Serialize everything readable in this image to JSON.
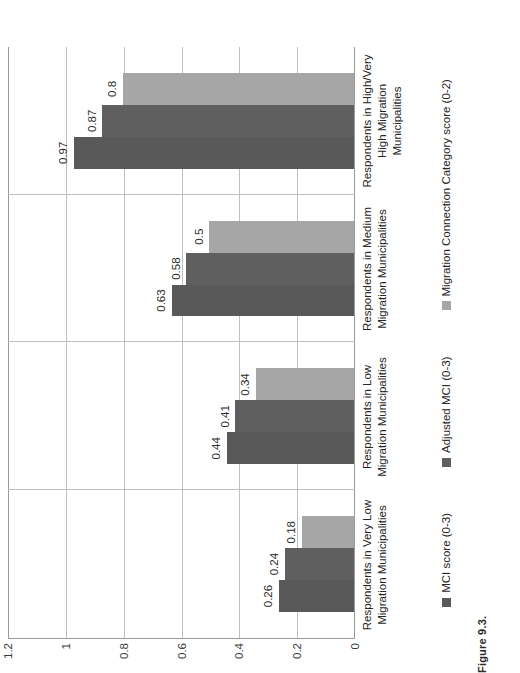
{
  "caption": "Figure 9.3.",
  "chart_data": {
    "type": "bar",
    "orientation": "horizontal",
    "title": "",
    "xlabel": "",
    "ylabel": "",
    "ylim": [
      0,
      1.2
    ],
    "grid": true,
    "legend_position": "bottom",
    "yticks": [
      "0",
      "0.2",
      "0.4",
      "0.6",
      "0.8",
      "1",
      "1.2"
    ],
    "ytick_values": [
      0,
      0.2,
      0.4,
      0.6,
      0.8,
      1,
      1.2
    ],
    "categories": [
      "Respondents in Very Low Migration Municipalities",
      "Respondents in Low Migration Municipalities",
      "Respondents in Medium Migration Municipalities",
      "Respondents in High/Very High Migration Municipalities"
    ],
    "series": [
      {
        "name": "MCI score (0-3)",
        "color": "#595959",
        "values": [
          0.26,
          0.44,
          0.63,
          0.97
        ],
        "labels": [
          "0.26",
          "0.44",
          "0.63",
          "0.97"
        ]
      },
      {
        "name": "Adjusted MCI (0-3)",
        "color": "#5f5f5f",
        "values": [
          0.24,
          0.41,
          0.58,
          0.87
        ],
        "labels": [
          "0.24",
          "0.41",
          "0.58",
          "0.87"
        ]
      },
      {
        "name": "Migration Connection Category score (0-2)",
        "color": "#a6a6a6",
        "values": [
          0.18,
          0.34,
          0.5,
          0.8
        ],
        "labels": [
          "0.18",
          "0.34",
          "0.5",
          "0.8"
        ]
      }
    ]
  }
}
